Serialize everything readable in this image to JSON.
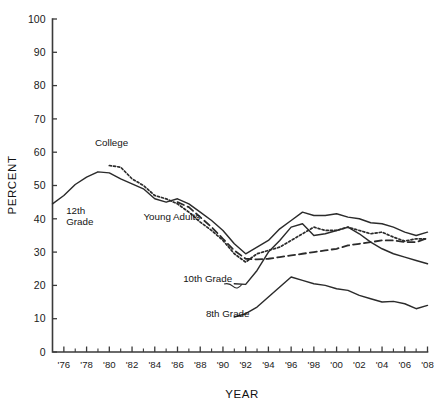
{
  "chart_data": {
    "type": "line",
    "title": "",
    "xlabel": "YEAR",
    "ylabel": "PERCENT",
    "ylim": [
      0,
      100
    ],
    "xlim": [
      1975,
      2008
    ],
    "grid": false,
    "legend_position": "inline-annotations",
    "yticks": [
      0,
      10,
      20,
      30,
      40,
      50,
      60,
      70,
      80,
      90,
      100
    ],
    "ytick_labels": [
      "0",
      "10",
      "20",
      "30",
      "40",
      "50",
      "60",
      "70",
      "80",
      "90",
      "100"
    ],
    "xticks": [
      1976,
      1978,
      1980,
      1982,
      1984,
      1986,
      1988,
      1990,
      1992,
      1994,
      1996,
      1998,
      2000,
      2002,
      2004,
      2006,
      2008
    ],
    "xtick_labels": [
      "'76",
      "'78",
      "'80",
      "'82",
      "'84",
      "'86",
      "'88",
      "'90",
      "'92",
      "'94",
      "'96",
      "'98",
      "'00",
      "'02",
      "'04",
      "'06",
      "'08"
    ],
    "xtick_minor_interval": 1,
    "series": [
      {
        "name": "12th Grade",
        "style": "solid",
        "label": "12th\nGrade",
        "x": [
          1975,
          1976,
          1977,
          1978,
          1979,
          1980,
          1981,
          1982,
          1983,
          1984,
          1985,
          1986,
          1987,
          1988,
          1989,
          1990,
          1991,
          1992,
          1993,
          1994,
          1995,
          1996,
          1997,
          1998,
          1999,
          2000,
          2001,
          2002,
          2003,
          2004,
          2005,
          2006,
          2007,
          2008
        ],
        "values": [
          44.5,
          47.0,
          50.3,
          52.5,
          54.1,
          53.8,
          52.0,
          50.5,
          49.0,
          46.0,
          45.0,
          46.0,
          44.5,
          42.0,
          39.5,
          36.5,
          32.5,
          29.5,
          31.5,
          33.5,
          37.0,
          39.5,
          42.0,
          41.0,
          41.0,
          41.5,
          40.5,
          40.0,
          38.8,
          38.5,
          37.5,
          36.0,
          35.0,
          36.0
        ]
      },
      {
        "name": "College",
        "style": "dotted",
        "label": "College",
        "x": [
          1980,
          1981,
          1982,
          1983,
          1984,
          1985,
          1986,
          1987,
          1988,
          1989,
          1990,
          1991,
          1992,
          1993,
          1994,
          1995,
          1996,
          1997,
          1998,
          1999,
          2000,
          2001,
          2002,
          2003,
          2004,
          2005,
          2006,
          2007,
          2008
        ],
        "values": [
          56.0,
          55.5,
          52.0,
          50.0,
          47.0,
          46.0,
          44.5,
          42.0,
          39.0,
          36.5,
          33.5,
          29.5,
          27.0,
          29.5,
          30.5,
          31.5,
          33.5,
          35.5,
          37.5,
          36.5,
          36.5,
          37.5,
          36.5,
          35.5,
          36.0,
          34.5,
          33.3,
          34.0,
          34.0
        ]
      },
      {
        "name": "Young Adults",
        "style": "dashed",
        "label": "Young Adults",
        "x": [
          1986,
          1987,
          1988,
          1989,
          1990,
          1991,
          1992,
          1993,
          1994,
          1995,
          1996,
          1997,
          1998,
          1999,
          2000,
          2001,
          2002,
          2003,
          2004,
          2005,
          2006,
          2007,
          2008
        ],
        "values": [
          45.0,
          43.5,
          40.5,
          37.5,
          34.0,
          30.5,
          28.0,
          27.8,
          28.0,
          28.5,
          29.0,
          29.5,
          30.0,
          30.5,
          31.0,
          32.0,
          32.5,
          33.0,
          33.5,
          33.5,
          33.0,
          33.0,
          34.2
        ]
      },
      {
        "name": "10th Grade",
        "style": "solid",
        "label": "10th Grade",
        "x": [
          1991,
          1992,
          1993,
          1994,
          1995,
          1996,
          1997,
          1998,
          1999,
          2000,
          2001,
          2002,
          2003,
          2004,
          2005,
          2006,
          2007,
          2008
        ],
        "values": [
          20.5,
          20.3,
          24.5,
          30.0,
          33.5,
          37.5,
          38.5,
          35.0,
          35.5,
          36.5,
          37.5,
          35.5,
          33.0,
          31.0,
          29.5,
          28.5,
          27.5,
          26.5
        ]
      },
      {
        "name": "8th Grade",
        "style": "solid",
        "label": "8th Grade",
        "x": [
          1991,
          1992,
          1993,
          1994,
          1995,
          1996,
          1997,
          1998,
          1999,
          2000,
          2001,
          2002,
          2003,
          2004,
          2005,
          2006,
          2007,
          2008
        ],
        "values": [
          10.5,
          11.5,
          13.5,
          16.5,
          19.5,
          22.5,
          21.5,
          20.5,
          20.0,
          19.0,
          18.5,
          17.0,
          16.0,
          15.0,
          15.2,
          14.5,
          13.0,
          14.0
        ]
      }
    ],
    "annotations": [
      {
        "text": "College",
        "x": 1980.2,
        "y": 62.0,
        "anchor": "middle"
      },
      {
        "text": "12th",
        "x": 1976.2,
        "y": 41.5,
        "anchor": "start"
      },
      {
        "text": "Grade",
        "x": 1976.2,
        "y": 38.0,
        "anchor": "start"
      },
      {
        "text": "Young Adults",
        "x": 1983.0,
        "y": 39.5,
        "anchor": "start"
      },
      {
        "text": "10th Grade",
        "x": 1986.5,
        "y": 21.0,
        "anchor": "start"
      },
      {
        "text": "8th Grade",
        "x": 1988.5,
        "y": 10.5,
        "anchor": "start"
      }
    ]
  },
  "footer": {
    "partial_caption": ""
  }
}
